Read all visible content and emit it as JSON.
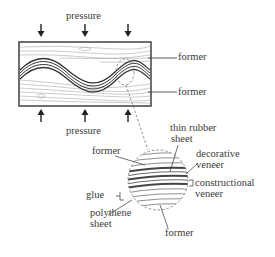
{
  "labels": {
    "pressure_top": "pressure",
    "pressure_bottom": "pressure",
    "former_upper": "former",
    "former_lower": "former",
    "thin_rubber_sheet": [
      "thin rubber",
      "sheet"
    ],
    "decorative_veneer": [
      "decorative",
      "veneer"
    ],
    "constructional_veneer": [
      "constructional",
      "veneer"
    ],
    "former_detail_top": "former",
    "former_detail_bottom": "former",
    "glue": "glue",
    "polythene_sheet": [
      "polythene",
      "sheet"
    ]
  },
  "colors": {
    "line": "#333333",
    "dashed": "#777777",
    "background": "#ffffff"
  }
}
